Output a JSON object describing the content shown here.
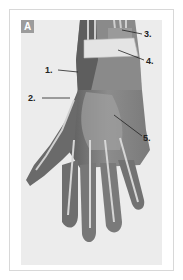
{
  "figure": {
    "panel_letter": "A",
    "labels": [
      {
        "id": 1,
        "text": "1."
      },
      {
        "id": 2,
        "text": "2."
      },
      {
        "id": 3,
        "text": "3."
      },
      {
        "id": 4,
        "text": "4."
      },
      {
        "id": 5,
        "text": "5."
      }
    ],
    "colors": {
      "page_bg": "#ffffff",
      "card_border": "#d8d8d8",
      "panel_bg": "#ececec",
      "badge_bg": "#9c9c9c",
      "skin_dark": "#5e5e5e",
      "skin_mid": "#8a8a8a",
      "tendon_light": "#d6d6d6",
      "band": "#e4e4e4"
    }
  }
}
